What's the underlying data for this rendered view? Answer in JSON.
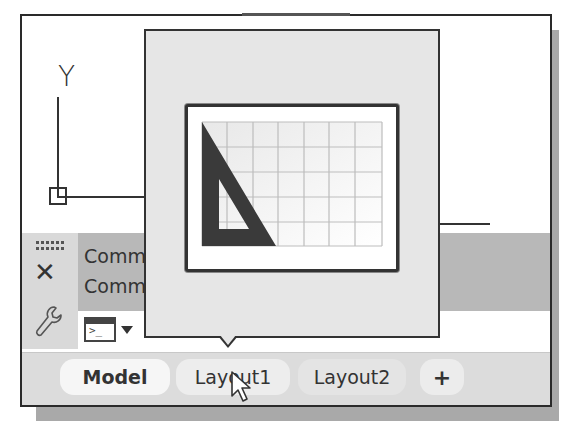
{
  "canvas": {
    "ucs_icon": {
      "y_label": "Y"
    }
  },
  "command_panel": {
    "history": [
      "Comma",
      "Comma"
    ],
    "icons": {
      "grip": "grip-handle-icon",
      "close": "close-icon",
      "customize": "wrench-icon",
      "prompt": "command-prompt-icon",
      "recent": "chevron-down-icon"
    },
    "close_glyph": "✕",
    "prompt_glyph": ">_"
  },
  "layout_tabs": {
    "tabs": [
      {
        "label": "Model",
        "active": true
      },
      {
        "label": "Layout1",
        "active": false,
        "hovered": true
      },
      {
        "label": "Layout2",
        "active": false
      }
    ],
    "add_label": "+"
  },
  "preview_popup": {
    "for_tab": "Layout1",
    "thumbnail_icon": "layout-sheet-triangle-icon"
  },
  "colors": {
    "border": "#2a2a2a",
    "panel": "#d9d9d9",
    "history": "#b8b8b8",
    "preview_bg": "#e6e6e6"
  }
}
